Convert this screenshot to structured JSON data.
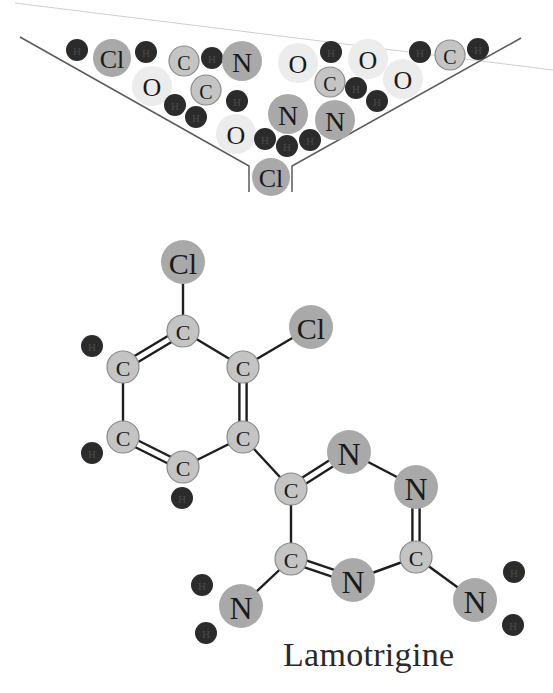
{
  "title": "Lamotrigine",
  "colors": {
    "hydrogen": "#2b2b2b",
    "hydrogen_text": "#555555",
    "chlorine": "#a9a9a9",
    "nitrogen": "#a9a9a9",
    "carbon": "#c4c4c4",
    "carbon_stroke": "#8a8a8a",
    "oxygen": "#ececec",
    "bond": "#1e1e1e",
    "funnel": "#5a5a5a",
    "faint_line": "#cfcfcf"
  },
  "funnel": {
    "left_line": [
      [
        20,
        37
      ],
      [
        249,
        166
      ],
      [
        249,
        192
      ]
    ],
    "right_line": [
      [
        521,
        38
      ],
      [
        292,
        166
      ],
      [
        292,
        192
      ]
    ],
    "faint_line": [
      [
        15,
        3
      ],
      [
        553,
        70
      ]
    ],
    "atoms": [
      {
        "el": "H",
        "x": 77,
        "y": 50
      },
      {
        "el": "Cl",
        "x": 112,
        "y": 58
      },
      {
        "el": "H",
        "x": 146,
        "y": 52
      },
      {
        "el": "C",
        "x": 184,
        "y": 61
      },
      {
        "el": "H",
        "x": 212,
        "y": 58
      },
      {
        "el": "N",
        "x": 242,
        "y": 61
      },
      {
        "el": "O",
        "x": 152,
        "y": 86
      },
      {
        "el": "C",
        "x": 206,
        "y": 90
      },
      {
        "el": "H",
        "x": 175,
        "y": 105
      },
      {
        "el": "H",
        "x": 196,
        "y": 117
      },
      {
        "el": "H",
        "x": 237,
        "y": 101
      },
      {
        "el": "O",
        "x": 236,
        "y": 134
      },
      {
        "el": "O",
        "x": 298,
        "y": 63
      },
      {
        "el": "H",
        "x": 331,
        "y": 52
      },
      {
        "el": "O",
        "x": 368,
        "y": 59
      },
      {
        "el": "C",
        "x": 330,
        "y": 82
      },
      {
        "el": "H",
        "x": 356,
        "y": 88
      },
      {
        "el": "H",
        "x": 377,
        "y": 101
      },
      {
        "el": "O",
        "x": 403,
        "y": 79
      },
      {
        "el": "N",
        "x": 288,
        "y": 114
      },
      {
        "el": "N",
        "x": 335,
        "y": 120
      },
      {
        "el": "H",
        "x": 265,
        "y": 139
      },
      {
        "el": "H",
        "x": 287,
        "y": 146
      },
      {
        "el": "H",
        "x": 310,
        "y": 140
      },
      {
        "el": "Cl",
        "x": 271,
        "y": 177
      },
      {
        "el": "H",
        "x": 420,
        "y": 52
      },
      {
        "el": "C",
        "x": 450,
        "y": 55
      },
      {
        "el": "H",
        "x": 478,
        "y": 49
      }
    ]
  },
  "molecule": {
    "atoms": [
      {
        "id": "cl1",
        "el": "Cl",
        "x": 183,
        "y": 262
      },
      {
        "id": "c1",
        "el": "C",
        "x": 183,
        "y": 331
      },
      {
        "id": "cl2",
        "el": "Cl",
        "x": 311,
        "y": 327
      },
      {
        "id": "c2",
        "el": "C",
        "x": 243,
        "y": 367
      },
      {
        "id": "c6",
        "el": "C",
        "x": 123,
        "y": 367
      },
      {
        "id": "c5",
        "el": "C",
        "x": 123,
        "y": 437
      },
      {
        "id": "c3",
        "el": "C",
        "x": 243,
        "y": 437
      },
      {
        "id": "c4",
        "el": "C",
        "x": 183,
        "y": 467
      },
      {
        "id": "h6",
        "el": "H",
        "x": 92,
        "y": 346
      },
      {
        "id": "h5",
        "el": "H",
        "x": 92,
        "y": 453
      },
      {
        "id": "h4",
        "el": "H",
        "x": 182,
        "y": 498
      },
      {
        "id": "c7",
        "el": "C",
        "x": 291,
        "y": 489
      },
      {
        "id": "n1",
        "el": "N",
        "x": 349,
        "y": 452
      },
      {
        "id": "n2",
        "el": "N",
        "x": 416,
        "y": 487
      },
      {
        "id": "c9",
        "el": "C",
        "x": 416,
        "y": 557
      },
      {
        "id": "n3",
        "el": "N",
        "x": 353,
        "y": 580
      },
      {
        "id": "c8",
        "el": "C",
        "x": 291,
        "y": 559
      },
      {
        "id": "n4",
        "el": "N",
        "x": 241,
        "y": 606
      },
      {
        "id": "n5",
        "el": "N",
        "x": 475,
        "y": 600
      },
      {
        "id": "ha1",
        "el": "H",
        "x": 202,
        "y": 585
      },
      {
        "id": "ha2",
        "el": "H",
        "x": 206,
        "y": 633
      },
      {
        "id": "hb1",
        "el": "H",
        "x": 514,
        "y": 572
      },
      {
        "id": "hb2",
        "el": "H",
        "x": 513,
        "y": 625
      }
    ],
    "bonds": [
      {
        "a": "cl1",
        "b": "c1",
        "order": 1
      },
      {
        "a": "c1",
        "b": "c2",
        "order": 1
      },
      {
        "a": "c1",
        "b": "c6",
        "order": 2
      },
      {
        "a": "c2",
        "b": "cl2",
        "order": 1
      },
      {
        "a": "c2",
        "b": "c3",
        "order": 2
      },
      {
        "a": "c6",
        "b": "c5",
        "order": 1
      },
      {
        "a": "c5",
        "b": "c4",
        "order": 2
      },
      {
        "a": "c4",
        "b": "c3",
        "order": 1
      },
      {
        "a": "c3",
        "b": "c7",
        "order": 1
      },
      {
        "a": "c7",
        "b": "n1",
        "order": 2
      },
      {
        "a": "n1",
        "b": "n2",
        "order": 1
      },
      {
        "a": "n2",
        "b": "c9",
        "order": 2
      },
      {
        "a": "c9",
        "b": "n3",
        "order": 1
      },
      {
        "a": "n3",
        "b": "c8",
        "order": 2
      },
      {
        "a": "c8",
        "b": "c7",
        "order": 1
      },
      {
        "a": "c8",
        "b": "n4",
        "order": 1
      },
      {
        "a": "c9",
        "b": "n5",
        "order": 1
      }
    ]
  }
}
